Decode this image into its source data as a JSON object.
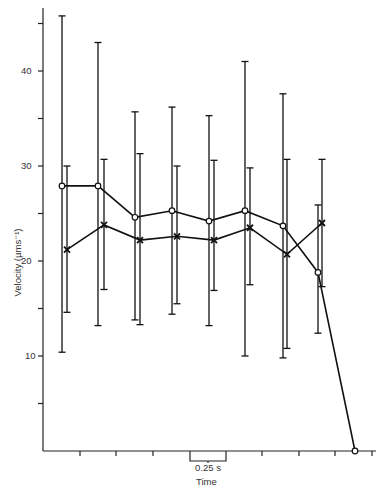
{
  "chart_data": {
    "type": "line",
    "title": "",
    "xlabel": "Time",
    "ylabel": "Velocity (µms⁻¹)",
    "ylim": [
      0,
      47
    ],
    "y_ticks": [
      10,
      20,
      30,
      40
    ],
    "y_minor_ticks": [
      5,
      15,
      25,
      35,
      45
    ],
    "x_scale_bar": "0.25 s",
    "grid": false,
    "legend": "none",
    "series": [
      {
        "name": "open-circle",
        "marker": "o",
        "x_px": [
          62,
          98,
          135,
          172,
          209,
          245,
          283,
          318,
          355
        ],
        "values": [
          27.9,
          27.9,
          24.6,
          25.3,
          24.2,
          25.3,
          23.7,
          18.8,
          0
        ],
        "err_upper": [
          45.8,
          43.0,
          35.7,
          36.2,
          35.3,
          41.0,
          37.6,
          25.9,
          null
        ],
        "err_lower": [
          10.4,
          13.2,
          13.8,
          14.4,
          13.2,
          10.0,
          9.8,
          12.4,
          null
        ]
      },
      {
        "name": "cross",
        "marker": "x",
        "x_px": [
          67,
          104,
          140,
          177,
          214,
          250,
          287,
          322
        ],
        "values": [
          21.2,
          23.8,
          22.2,
          22.6,
          22.2,
          23.5,
          20.7,
          24.0
        ],
        "err_upper": [
          30.0,
          30.7,
          31.3,
          30.0,
          30.6,
          29.8,
          30.7,
          30.7
        ],
        "err_lower": [
          14.6,
          17.0,
          13.3,
          15.5,
          16.9,
          17.5,
          10.8,
          17.3
        ]
      }
    ]
  },
  "labels": {
    "y_ticks": [
      "10",
      "20",
      "30",
      "40"
    ],
    "ylabel": "Velocity (µms⁻¹)",
    "xlabel": "Time",
    "scale": "0.25 s"
  }
}
